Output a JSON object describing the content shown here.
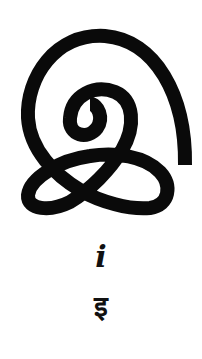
{
  "glyph": {
    "icon": "spiral-knot-glyph-icon",
    "stroke_color": "#0a0a0a",
    "background": "#ffffff"
  },
  "labels": {
    "latin": "i",
    "devanagari": "इ"
  }
}
